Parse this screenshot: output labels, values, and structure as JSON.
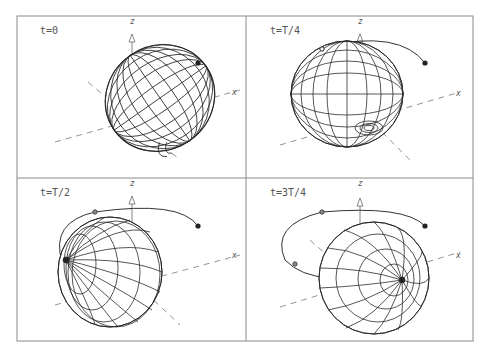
{
  "figure": {
    "panels": [
      {
        "id": "p1",
        "label": "t=0",
        "axis_z": "z",
        "axis_x": "x"
      },
      {
        "id": "p2",
        "label": "t=T/4",
        "axis_z": "z",
        "axis_x": "x"
      },
      {
        "id": "p3",
        "label": "t=T/2",
        "axis_z": "z",
        "axis_x": "x"
      },
      {
        "id": "p4",
        "label": "t=3T/4",
        "axis_z": "z",
        "axis_x": "x"
      }
    ],
    "colors": {
      "frame": "#8a8a8a",
      "mesh": "#2b2b2b",
      "axis": "#777777",
      "marker": "#222222"
    }
  }
}
